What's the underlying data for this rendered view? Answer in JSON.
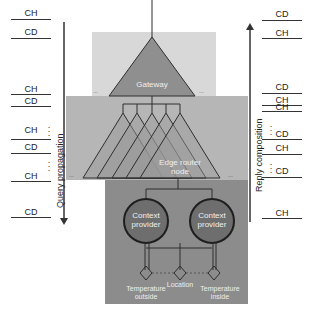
{
  "diagram": {
    "left_arrow_label": "Query propagation",
    "right_arrow_label": "Reply composition",
    "left_labels": [
      {
        "text": "CH",
        "y": 10
      },
      {
        "text": "CD",
        "y": 29
      },
      {
        "text": "CH",
        "y": 86
      },
      {
        "text": "CD",
        "y": 98
      },
      {
        "text": "CH",
        "y": 125
      },
      {
        "text": "CD",
        "y": 144
      },
      {
        "text": "CH",
        "y": 172
      },
      {
        "text": "CD",
        "y": 208
      }
    ],
    "right_labels": [
      {
        "text": "CD",
        "y": 10
      },
      {
        "text": "CH",
        "y": 29
      },
      {
        "text": "CD",
        "y": 86
      },
      {
        "text": "CH",
        "y": 98
      },
      {
        "text": "CH",
        "y": 103
      },
      {
        "text": "CD",
        "y": 128
      },
      {
        "text": "CH",
        "y": 144
      },
      {
        "text": "CD",
        "y": 165
      },
      {
        "text": "CH",
        "y": 208
      }
    ],
    "gateway_label": "Gateway",
    "edge_router_label_line1": "Edge router",
    "edge_router_label_line2": "node",
    "context_provider_1_line1": "Context",
    "context_provider_1_line2": "provider",
    "context_provider_2_line1": "Context",
    "context_provider_2_line2": "provider",
    "sensors": [
      {
        "line1": "Temperature",
        "line2": "outside"
      },
      {
        "line1": "Location",
        "line2": ""
      },
      {
        "line1": "Temperature",
        "line2": "inside"
      }
    ],
    "ellipsis": "...",
    "colors": {
      "gateway_layer": "#d6d6d6",
      "router_layer": "#b4b4b4",
      "provider_layer": "#8a8a8a",
      "triangle_fill": "#8f8f8f",
      "circle_fill": "#6e6e6e",
      "line": "#2e2e2e"
    }
  }
}
